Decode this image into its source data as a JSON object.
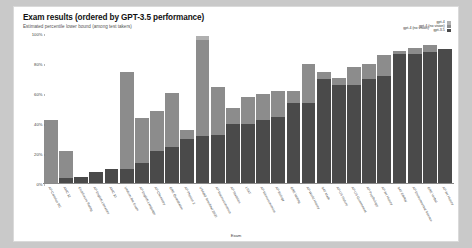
{
  "card": {
    "title": "Exam results (ordered by GPT-3.5 performance)",
    "subtitle": "Estimated percentile lower bound (among test takers)"
  },
  "legend": {
    "left_label": "gpt-4 (no vision)",
    "entries": [
      {
        "label": "gpt-4",
        "color": "#b0b0b0"
      },
      {
        "label": "gpt-4 (no vision)",
        "color": "#8c8c8c"
      },
      {
        "label": "gpt-3.5",
        "color": "#4a4a4a"
      }
    ]
  },
  "chart_data": {
    "type": "bar",
    "title": "Exam results (ordered by GPT-3.5 performance)",
    "subtitle": "Estimated percentile lower bound (among test takers)",
    "xlabel": "Exam",
    "ylabel": "",
    "ylim": [
      0,
      100
    ],
    "yticks": [
      "0%",
      "20%",
      "40%",
      "60%",
      "80%",
      "100%"
    ],
    "ytick_values": [
      0,
      20,
      40,
      60,
      80,
      100
    ],
    "grid": false,
    "stacked": true,
    "legend_position": "top-right",
    "categories": [
      "AP Calculus BC",
      "AMC 12",
      "Codeforces Rating",
      "AP English Literature",
      "AMC 10",
      "Uniform Bar Exam",
      "AP English Language",
      "AP Chemistry",
      "GRE Quantitative",
      "AP Physics 2",
      "USABO Semifinal 2020",
      "AP Macroeconomics",
      "AP Statistics",
      "LSAT",
      "AP Microeconomics",
      "AP Biology",
      "GRE Writing",
      "AP World History",
      "SAT Math",
      "AP US History",
      "AP US Government",
      "AP Psychology",
      "AP Art History",
      "SAT EBRW",
      "AP Environmental Science",
      "GRE Verbal",
      "AP Art History"
    ],
    "series": [
      {
        "name": "gpt-3.5",
        "color": "#4a4a4a",
        "values": [
          1,
          4,
          5,
          8,
          10,
          10,
          14,
          22,
          25,
          30,
          32,
          33,
          40,
          40,
          43,
          45,
          54,
          54,
          70,
          66,
          66,
          70,
          72,
          87,
          87,
          88,
          90
        ]
      },
      {
        "name": "gpt-4 (no vision)",
        "color": "#8c8c8c",
        "values": [
          43,
          22,
          5,
          8,
          10,
          75,
          44,
          49,
          61,
          36,
          96,
          65,
          51,
          58,
          60,
          62,
          62,
          80,
          75,
          71,
          78,
          80,
          86,
          89,
          91,
          93,
          90
        ]
      },
      {
        "name": "gpt-4",
        "color": "#b0b0b0",
        "values": [
          43,
          22,
          5,
          8,
          10,
          75,
          44,
          49,
          61,
          36,
          99,
          65,
          51,
          58,
          60,
          62,
          62,
          80,
          75,
          71,
          78,
          80,
          86,
          89,
          91,
          93,
          90
        ]
      }
    ]
  },
  "xaxis_title": "Exam"
}
